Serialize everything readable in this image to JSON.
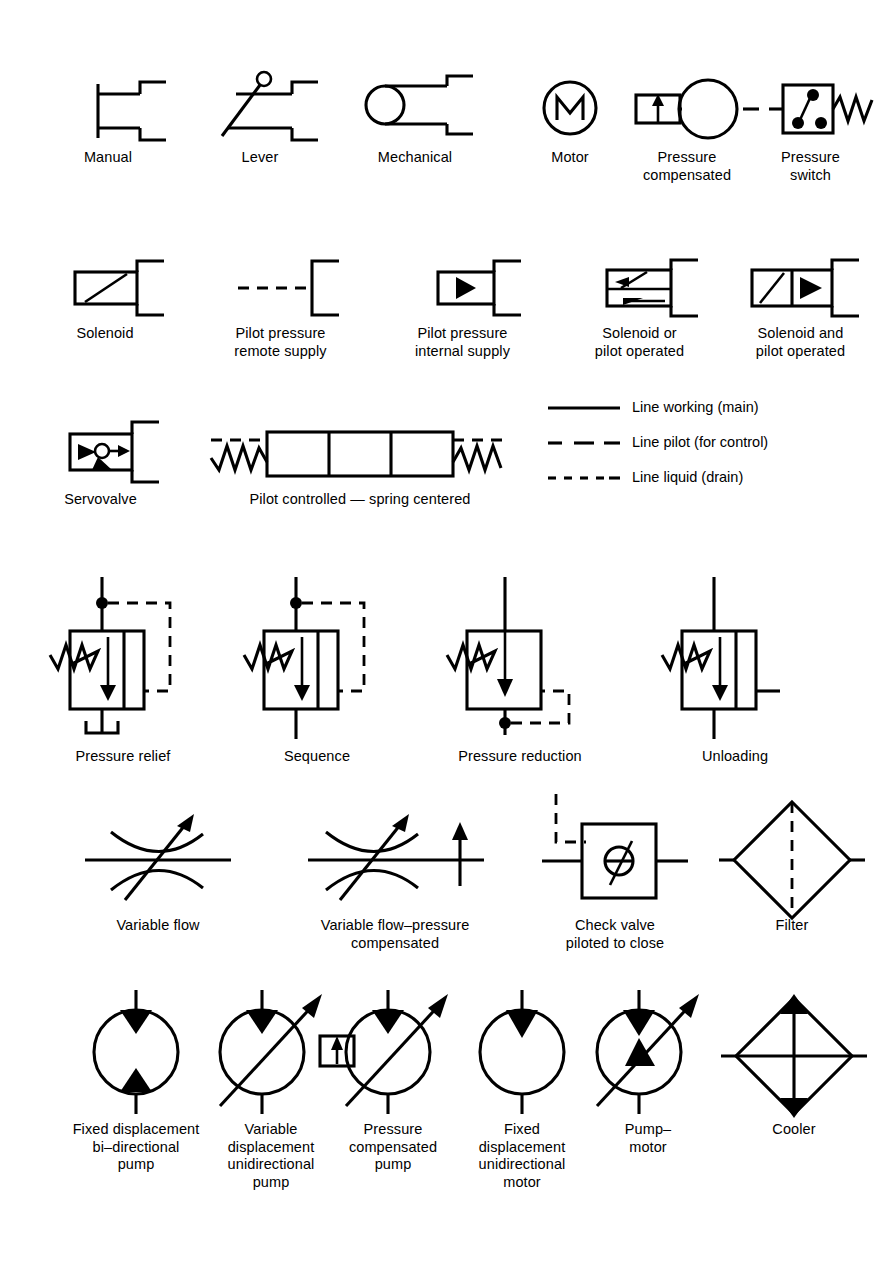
{
  "figure": {
    "kind": "hydraulic-symbol-chart",
    "background_color": "#ffffff",
    "ink_color": "#000000"
  },
  "rows": {
    "actuators": [
      {
        "id": "manual",
        "caption": "Manual"
      },
      {
        "id": "lever",
        "caption": "Lever"
      },
      {
        "id": "mechanical",
        "caption": "Mechanical"
      },
      {
        "id": "motor",
        "caption": "Motor"
      },
      {
        "id": "pressure-compensated",
        "caption": "Pressure\ncompensated"
      },
      {
        "id": "pressure-switch",
        "caption": "Pressure\nswitch"
      }
    ],
    "pilots": [
      {
        "id": "solenoid",
        "caption": "Solenoid"
      },
      {
        "id": "pilot-pressure-remote-supply",
        "caption": "Pilot pressure\nremote supply"
      },
      {
        "id": "pilot-pressure-internal-supply",
        "caption": "Pilot pressure\ninternal supply"
      },
      {
        "id": "solenoid-or-pilot-operated",
        "caption": "Solenoid or\npilot operated"
      },
      {
        "id": "solenoid-and-pilot-operated",
        "caption": "Solenoid and\npilot operated"
      }
    ],
    "valves_spool": [
      {
        "id": "servovalve",
        "caption": "Servovalve"
      },
      {
        "id": "pilot-controlled-spring-centered",
        "caption": "Pilot controlled — spring centered"
      }
    ],
    "pressure_valves": [
      {
        "id": "pressure-relief",
        "caption": "Pressure relief"
      },
      {
        "id": "sequence",
        "caption": "Sequence"
      },
      {
        "id": "pressure-reduction",
        "caption": "Pressure reduction"
      },
      {
        "id": "unloading",
        "caption": "Unloading"
      }
    ],
    "flow_controls": [
      {
        "id": "variable-flow",
        "caption": "Variable flow"
      },
      {
        "id": "variable-flow-pressure-compensated",
        "caption": "Variable flow–pressure\ncompensated"
      },
      {
        "id": "check-valve-piloted-to-close",
        "caption": "Check valve\npiloted to close"
      },
      {
        "id": "filter",
        "caption": "Filter"
      }
    ],
    "pumps": [
      {
        "id": "fixed-displacement-bi-directional-pump",
        "caption": "Fixed displacement\nbi–directional\npump"
      },
      {
        "id": "variable-displacement-unidirectional-pump",
        "caption": "Variable\ndisplacement\nunidirectional\npump"
      },
      {
        "id": "pressure-compensated-pump",
        "caption": "Pressure\ncompensated\npump"
      },
      {
        "id": "fixed-displacement-unidirectional-motor",
        "caption": "Fixed\ndisplacement\nunidirectional\nmotor"
      },
      {
        "id": "pump-motor",
        "caption": "Pump–\nmotor"
      },
      {
        "id": "cooler",
        "caption": "Cooler"
      }
    ]
  },
  "line_legend": [
    {
      "id": "line-working-main",
      "style": "solid",
      "label": "Line working (main)"
    },
    {
      "id": "line-pilot-for-control",
      "style": "dashed",
      "label": "Line pilot (for control)"
    },
    {
      "id": "line-liquid-drain",
      "style": "dotted",
      "label": "Line liquid (drain)"
    }
  ]
}
